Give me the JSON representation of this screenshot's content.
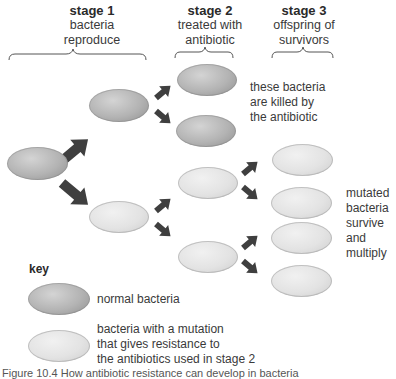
{
  "stages": [
    {
      "title": "stage 1",
      "subtitle_lines": [
        "bacteria",
        "reproduce"
      ]
    },
    {
      "title": "stage 2",
      "subtitle_lines": [
        "treated with",
        "antibiotic"
      ]
    },
    {
      "title": "stage 3",
      "subtitle_lines": [
        "offspring of",
        "survivors"
      ]
    }
  ],
  "annotations": {
    "killed": [
      "these bacteria",
      "are killed by",
      "the antibiotic"
    ],
    "survive": [
      "mutated",
      "bacteria",
      "survive",
      "and",
      "multiply"
    ]
  },
  "key": {
    "title": "key",
    "normal_label": "normal bacteria",
    "mutant_label_lines": [
      "bacteria with a mutation",
      "that gives resistance to",
      "the antibiotics used in stage 2"
    ]
  },
  "colors": {
    "normal_bacteria": "#b3b3b3",
    "mutant_bacteria": "#e3e3e3",
    "arrow": "#3f3f3f",
    "brace": "#555555"
  },
  "caption": "Figure 10.4 How antibiotic resistance can develop in bacteria"
}
